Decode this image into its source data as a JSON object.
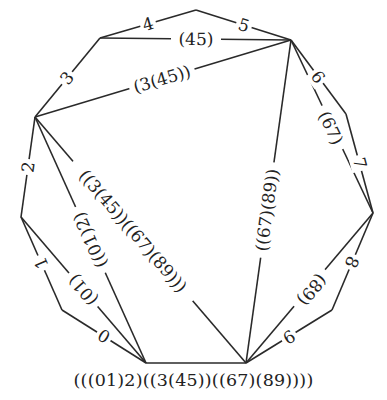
{
  "diagram": {
    "type": "polygon-triangulation",
    "caption": "(((01)2)((3(45))((67)(89))))",
    "vertices": [
      {
        "id": "A",
        "x": 146,
        "y": 363
      },
      {
        "id": "P1",
        "x": 62,
        "y": 310
      },
      {
        "id": "P2",
        "x": 21,
        "y": 217
      },
      {
        "id": "P3",
        "x": 35,
        "y": 117
      },
      {
        "id": "P4",
        "x": 100,
        "y": 38
      },
      {
        "id": "P5",
        "x": 196,
        "y": 10
      },
      {
        "id": "P6",
        "x": 291,
        "y": 40
      },
      {
        "id": "P7",
        "x": 346,
        "y": 114
      },
      {
        "id": "P8",
        "x": 373,
        "y": 213
      },
      {
        "id": "P9",
        "x": 332,
        "y": 310
      },
      {
        "id": "B",
        "x": 246,
        "y": 363
      }
    ],
    "sides": [
      {
        "from": "A",
        "to": "P1",
        "label": "0"
      },
      {
        "from": "P1",
        "to": "P2",
        "label": "1"
      },
      {
        "from": "P2",
        "to": "P3",
        "label": "2"
      },
      {
        "from": "P3",
        "to": "P4",
        "label": "3"
      },
      {
        "from": "P4",
        "to": "P5",
        "label": "4"
      },
      {
        "from": "P5",
        "to": "P6",
        "label": "5"
      },
      {
        "from": "P6",
        "to": "P7",
        "label": "6"
      },
      {
        "from": "P7",
        "to": "P8",
        "label": "7"
      },
      {
        "from": "P8",
        "to": "P9",
        "label": "8"
      },
      {
        "from": "P9",
        "to": "B",
        "label": "9"
      },
      {
        "from": "B",
        "to": "A",
        "label": ""
      }
    ],
    "diagonals": [
      {
        "from": "P4",
        "to": "P6",
        "label": "(45)"
      },
      {
        "from": "P3",
        "to": "P6",
        "label": "(3(45))"
      },
      {
        "from": "P2",
        "to": "A",
        "label": "(01)"
      },
      {
        "from": "P3",
        "to": "A",
        "label": "((01)2)"
      },
      {
        "from": "P3",
        "to": "B",
        "label": "((3(45))((67)(89)))"
      },
      {
        "from": "P6",
        "to": "B",
        "label": "((67)(89))"
      },
      {
        "from": "P6",
        "to": "P8",
        "label": "(67)"
      },
      {
        "from": "P8",
        "to": "B",
        "label": "(89)"
      }
    ]
  }
}
